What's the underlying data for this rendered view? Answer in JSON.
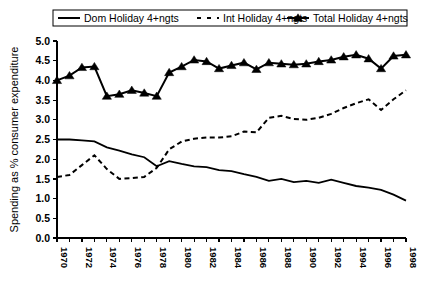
{
  "chart_data": {
    "type": "line",
    "title": "",
    "xlabel": "",
    "ylabel": "Spending as % consumer expenditure",
    "ylim": [
      0.0,
      5.0
    ],
    "ytick_step": 0.5,
    "yticks": [
      "0.0",
      "0.5",
      "1.0",
      "1.5",
      "2.0",
      "2.5",
      "3.0",
      "3.5",
      "4.0",
      "4.5",
      "5.0"
    ],
    "xlim": [
      1970,
      1998
    ],
    "grid": false,
    "legend_position": "top",
    "x": [
      1970,
      1971,
      1972,
      1973,
      1974,
      1975,
      1976,
      1977,
      1978,
      1979,
      1980,
      1981,
      1982,
      1983,
      1984,
      1985,
      1986,
      1987,
      1988,
      1989,
      1990,
      1991,
      1992,
      1993,
      1994,
      1995,
      1996,
      1997,
      1998
    ],
    "xtick_labels": [
      "1970",
      "",
      "1972",
      "",
      "1974",
      "",
      "1976",
      "",
      "1978",
      "",
      "1980",
      "",
      "1982",
      "",
      "1984",
      "",
      "1986",
      "",
      "1988",
      "",
      "1990",
      "",
      "1992",
      "",
      "1994",
      "",
      "1996",
      "",
      "1998"
    ],
    "series": [
      {
        "name": "Dom Holiday 4+ngts",
        "style": "solid",
        "marker": "none",
        "color": "#000000",
        "values": [
          2.5,
          2.5,
          2.48,
          2.45,
          2.3,
          2.22,
          2.12,
          2.05,
          1.82,
          1.95,
          1.88,
          1.82,
          1.8,
          1.72,
          1.7,
          1.62,
          1.55,
          1.45,
          1.5,
          1.42,
          1.45,
          1.4,
          1.48,
          1.4,
          1.32,
          1.28,
          1.22,
          1.1,
          0.95
        ]
      },
      {
        "name": "Int Holiday 4+ngts",
        "style": "dashed",
        "marker": "none",
        "color": "#000000",
        "values": [
          1.55,
          1.6,
          1.85,
          2.1,
          1.75,
          1.5,
          1.52,
          1.55,
          1.78,
          2.25,
          2.45,
          2.52,
          2.55,
          2.55,
          2.58,
          2.7,
          2.68,
          3.05,
          3.1,
          3.02,
          3.0,
          3.05,
          3.15,
          3.3,
          3.42,
          3.52,
          3.25,
          3.52,
          3.75
        ]
      },
      {
        "name": "Total Holiday 4+ngts",
        "style": "solid",
        "marker": "triangle",
        "color": "#000000",
        "values": [
          4.0,
          4.12,
          4.33,
          4.35,
          3.6,
          3.65,
          3.75,
          3.68,
          3.6,
          4.2,
          4.35,
          4.52,
          4.48,
          4.3,
          4.38,
          4.45,
          4.28,
          4.45,
          4.42,
          4.4,
          4.42,
          4.48,
          4.52,
          4.6,
          4.65,
          4.55,
          4.3,
          4.62,
          4.65
        ]
      }
    ],
    "legend": [
      {
        "label": "Dom Holiday 4+ngts",
        "style": "solid",
        "marker": "none"
      },
      {
        "label": "Int Holiday 4+ngts",
        "style": "dashed",
        "marker": "none"
      },
      {
        "label": "Total Holiday 4+ngts",
        "style": "solid",
        "marker": "triangle"
      }
    ]
  }
}
